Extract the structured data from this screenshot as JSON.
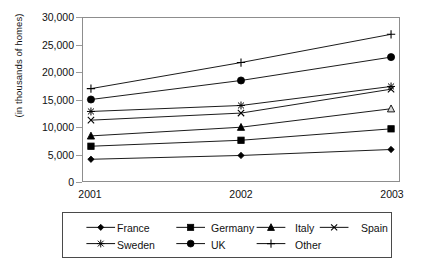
{
  "chart_data": {
    "type": "line",
    "title": "",
    "subtitle": "",
    "xlabel": "",
    "ylabel": "(in thousands of homes)",
    "categories": [
      "2001",
      "2002",
      "2003"
    ],
    "x": [
      2001,
      2002,
      2003
    ],
    "ylim": [
      0,
      30000
    ],
    "yticks": [
      0,
      5000,
      10000,
      15000,
      20000,
      25000,
      30000
    ],
    "ytick_labels": [
      "0",
      "5,000",
      "10,000",
      "15,000",
      "20,000",
      "25,000",
      "30,000"
    ],
    "grid": false,
    "legend_position": "bottom",
    "series": [
      {
        "name": "France",
        "marker": "diamond",
        "marker_style": "filled",
        "values": [
          4000,
          4700,
          5800
        ]
      },
      {
        "name": "Germany",
        "marker": "square",
        "marker_style": "filled",
        "values": [
          6400,
          7500,
          9600
        ]
      },
      {
        "name": "Italy",
        "marker": "triangle",
        "marker_style": "filled",
        "values": [
          8300,
          9900,
          13300
        ]
      },
      {
        "name": "Spain",
        "marker": "x",
        "marker_style": "line",
        "values": [
          11200,
          12500,
          16900
        ]
      },
      {
        "name": "Sweden",
        "marker": "asterisk",
        "marker_style": "line",
        "values": [
          12800,
          13900,
          17400
        ]
      },
      {
        "name": "UK",
        "marker": "circle",
        "marker_style": "filled",
        "values": [
          15000,
          18500,
          22800
        ]
      },
      {
        "name": "Other",
        "marker": "plus",
        "marker_style": "line",
        "values": [
          17000,
          21800,
          27000
        ]
      }
    ]
  },
  "legend": {
    "entries": [
      {
        "label": "France",
        "marker": "diamond"
      },
      {
        "label": "Germany",
        "marker": "square"
      },
      {
        "label": "Italy",
        "marker": "triangle"
      },
      {
        "label": "Spain",
        "marker": "x"
      },
      {
        "label": "Sweden",
        "marker": "asterisk"
      },
      {
        "label": "UK",
        "marker": "circle"
      },
      {
        "label": "Other",
        "marker": "plus"
      }
    ]
  },
  "colors": {
    "series": "#000000",
    "axis": "#8d8d8d",
    "text": "#111111",
    "background": "#ffffff",
    "legend_border": "#4a4a4a"
  }
}
